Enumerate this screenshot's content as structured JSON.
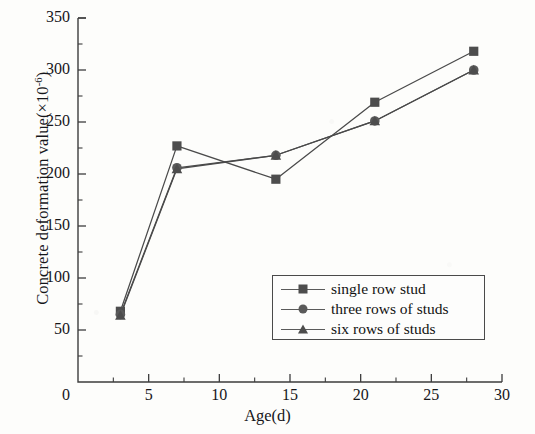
{
  "chart_data": {
    "type": "line",
    "title": "",
    "xlabel": "Age(d)",
    "ylabel": "Concrete deformation value(×10-6)",
    "ylabel_base": "Concrete deformation value(×10",
    "ylabel_exp": "-6",
    "ylabel_tail": ")",
    "x": [
      3,
      7,
      14,
      21,
      28
    ],
    "xlim": [
      0,
      30
    ],
    "ylim": [
      0,
      350
    ],
    "xticks": [
      0,
      5,
      10,
      15,
      20,
      25,
      30
    ],
    "yticks": [
      0,
      50,
      100,
      150,
      200,
      250,
      300,
      350
    ],
    "xtick_labels": [
      "0",
      "5",
      "10",
      "15",
      "20",
      "25",
      "30"
    ],
    "ytick_labels": [
      "0",
      "50",
      "100",
      "150",
      "200",
      "250",
      "300",
      "350"
    ],
    "x_minor_step": 2.5,
    "y_minor_step": 25,
    "grid": false,
    "legend_position": "lower right inside",
    "series": [
      {
        "name": "single row stud",
        "marker": "square",
        "color": "#4d4d4d",
        "values": [
          68,
          227,
          195,
          269,
          318
        ]
      },
      {
        "name": "three rows of studs",
        "marker": "circle",
        "color": "#5a5a5a",
        "values": [
          65,
          206,
          218,
          251,
          300
        ]
      },
      {
        "name": "six rows of studs",
        "marker": "triangle",
        "color": "#4d4d4d",
        "values": [
          64,
          205,
          218,
          251,
          300
        ]
      }
    ]
  },
  "legend": {
    "entries": [
      {
        "label": "single row stud",
        "marker": "square"
      },
      {
        "label": "three rows of studs",
        "marker": "circle"
      },
      {
        "label": "six rows of studs",
        "marker": "triangle"
      }
    ]
  },
  "axes": {
    "line_color": "#3d3d3d",
    "text_color": "#16161a"
  }
}
